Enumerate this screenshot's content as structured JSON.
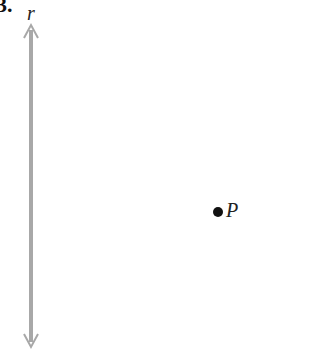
{
  "problem_number": "3.",
  "line": {
    "label": "r",
    "color": "#a8a8a8"
  },
  "point": {
    "label": "P",
    "color": "#111111"
  }
}
